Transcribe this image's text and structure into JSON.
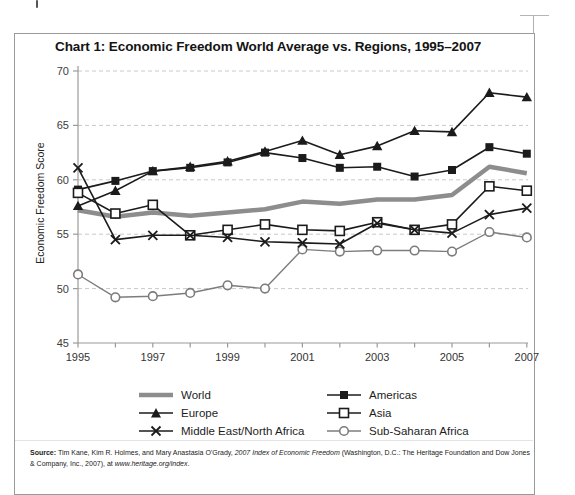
{
  "chart_data": {
    "type": "line",
    "title": "Chart 1: Economic Freedom World Average vs. Regions, 1995–2007",
    "ylabel": "Economic Freedom Score",
    "xlabel": "",
    "ylim": [
      45,
      70
    ],
    "ytick_step": 5,
    "grid": "horizontal-dashed",
    "legend_position": "bottom",
    "x": [
      1995,
      1996,
      1997,
      1998,
      1999,
      2000,
      2001,
      2002,
      2003,
      2004,
      2005,
      2006,
      2007
    ],
    "xtick_labels": [
      "1995",
      "1997",
      "1999",
      "2001",
      "2003",
      "2005",
      "2007"
    ],
    "series": [
      {
        "name": "World",
        "marker": "none",
        "color": "#8d8d8d",
        "line_width": 4.5,
        "values": [
          57.2,
          56.6,
          57.0,
          56.7,
          57.0,
          57.3,
          58.0,
          57.8,
          58.2,
          58.2,
          58.6,
          61.2,
          60.6
        ]
      },
      {
        "name": "Americas",
        "marker": "filled-square",
        "color": "#1b1b1b",
        "line_width": 1.6,
        "values": [
          59.1,
          59.9,
          60.8,
          61.1,
          61.6,
          62.5,
          62.0,
          61.1,
          61.2,
          60.3,
          60.9,
          63.0,
          62.4
        ]
      },
      {
        "name": "Europe",
        "marker": "filled-triangle",
        "color": "#1b1b1b",
        "line_width": 1.6,
        "values": [
          57.6,
          59.0,
          60.8,
          61.2,
          61.7,
          62.6,
          63.6,
          62.3,
          63.1,
          64.5,
          64.4,
          68.0,
          67.6
        ]
      },
      {
        "name": "Asia",
        "marker": "open-square",
        "color": "#1b1b1b",
        "line_width": 1.6,
        "values": [
          58.8,
          56.9,
          57.7,
          54.9,
          55.4,
          55.9,
          55.4,
          55.3,
          56.1,
          55.4,
          55.9,
          59.4,
          59.0
        ]
      },
      {
        "name": "Middle East/North Africa",
        "marker": "x",
        "color": "#1b1b1b",
        "line_width": 1.6,
        "values": [
          61.1,
          54.5,
          54.9,
          54.9,
          54.7,
          54.3,
          54.2,
          54.1,
          56.0,
          55.4,
          55.1,
          56.8,
          57.4
        ]
      },
      {
        "name": "Sub-Saharan Africa",
        "marker": "open-circle",
        "color": "#7c7c7c",
        "line_width": 1.4,
        "values": [
          51.3,
          49.2,
          49.3,
          49.6,
          50.3,
          50.0,
          53.6,
          53.4,
          53.5,
          53.5,
          53.4,
          55.2,
          54.7
        ]
      }
    ]
  },
  "legend": {
    "left_column": [
      "World",
      "Europe",
      "Middle East/North Africa"
    ],
    "right_column": [
      "Americas",
      "Asia",
      "Sub-Saharan Africa"
    ]
  },
  "source": {
    "segments": [
      {
        "t": "Source:",
        "b": true
      },
      {
        "t": " Tim Kane, Kim R. Holmes, and Mary Anastasia O'Grady, "
      },
      {
        "t": "2007 Index of Economic Freedom",
        "i": true
      },
      {
        "t": " (Washington, D.C.: The Heritage Foundation and Dow Jones & Company, Inc., 2007), at "
      },
      {
        "t": "www.heritage.org/index",
        "i": true
      },
      {
        "t": "."
      }
    ]
  }
}
